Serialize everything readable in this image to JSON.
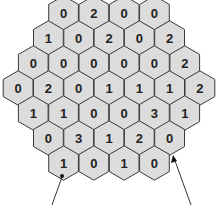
{
  "diagram": {
    "type": "hexagonal-grid",
    "cell_fill": "#dcdcdc",
    "cell_stroke": "#3a3a3a",
    "rows": [
      {
        "cells": [
          "0",
          "2",
          "0",
          "0"
        ]
      },
      {
        "cells": [
          "1",
          "0",
          "2",
          "0",
          "2"
        ]
      },
      {
        "cells": [
          "0",
          "0",
          "0",
          "0",
          "0",
          "2"
        ]
      },
      {
        "cells": [
          "0",
          "2",
          "0",
          "1",
          "1",
          "1",
          "2"
        ]
      },
      {
        "cells": [
          "1",
          "1",
          "0",
          "0",
          "3",
          "1"
        ]
      },
      {
        "cells": [
          "0",
          "3",
          "1",
          "2",
          "0"
        ]
      },
      {
        "cells": [
          "1",
          "0",
          "1",
          "0"
        ]
      }
    ],
    "annotations": [
      {
        "target_row": 7,
        "target_col": 1,
        "marker": "dot",
        "caption": "Te..."
      },
      {
        "target_row": 6,
        "target_col": 5,
        "marker": "arrow",
        "caption": "Th..."
      }
    ]
  }
}
